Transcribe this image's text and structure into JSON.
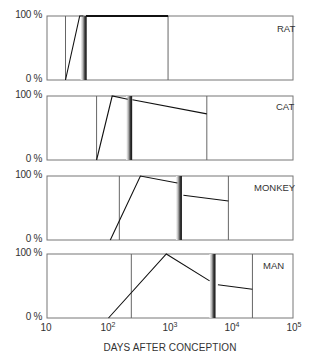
{
  "chart_data": {
    "type": "line",
    "title": "",
    "xlabel": "DAYS AFTER CONCEPTION",
    "ylabel": "",
    "xscale": "log",
    "xlim": [
      10,
      100000
    ],
    "ylim": [
      0,
      100
    ],
    "x_ticks": [
      {
        "base": "10",
        "exp": "",
        "value": 10
      },
      {
        "base": "10",
        "exp": "2",
        "value": 100
      },
      {
        "base": "10",
        "exp": "3",
        "value": 1000
      },
      {
        "base": "10",
        "exp": "4",
        "value": 10000
      },
      {
        "base": "10",
        "exp": "5",
        "value": 100000
      }
    ],
    "y_ticks": [
      "100 %",
      "0 %"
    ],
    "grid": false,
    "panels": [
      {
        "name": "RAT",
        "top": 16,
        "vlines": [
          20,
          930
        ],
        "birth": 41,
        "before_birth": [
          [
            20,
            0
          ],
          [
            34,
            100
          ],
          [
            39,
            100
          ]
        ],
        "after_birth": [
          [
            43,
            100
          ],
          [
            930,
            100
          ]
        ]
      },
      {
        "name": "CAT",
        "top": 96,
        "vlines": [
          64,
          3970
        ],
        "birth": 225,
        "before_birth": [
          [
            64,
            0
          ],
          [
            115,
            100
          ],
          [
            205,
            95
          ]
        ],
        "after_birth": [
          [
            245,
            94
          ],
          [
            3970,
            72
          ]
        ]
      },
      {
        "name": "MONKEY",
        "top": 176,
        "vlines": [
          150,
          8900
        ],
        "birth": 1450,
        "before_birth": [
          [
            107,
            0
          ],
          [
            330,
            100
          ],
          [
            1320,
            89
          ]
        ],
        "after_birth": [
          [
            1650,
            70
          ],
          [
            8900,
            61
          ]
        ]
      },
      {
        "name": "MAN",
        "top": 254,
        "vlines": [
          235,
          21900
        ],
        "birth": 5100,
        "before_birth": [
          [
            100,
            0
          ],
          [
            870,
            100
          ],
          [
            4400,
            58
          ]
        ],
        "after_birth": [
          [
            6000,
            52
          ],
          [
            21900,
            45
          ]
        ]
      }
    ]
  },
  "labels": {
    "y_top": "100 %",
    "y_bottom": "0 %",
    "xlabel": "DAYS AFTER CONCEPTION"
  }
}
